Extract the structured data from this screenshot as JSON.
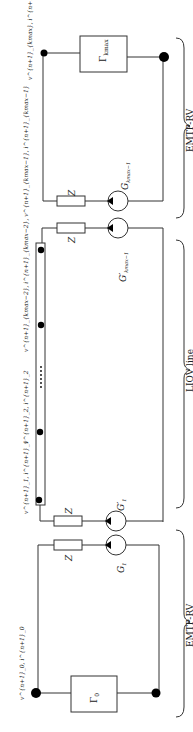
{
  "sections": {
    "top": "EMTP-RV",
    "middle": "LIOV line",
    "bottom": "EMTP-RV"
  },
  "components": {
    "gamma_top": "Γ_kmax",
    "gamma_bottom": "Γ_0",
    "impedance": "Z",
    "source_top": "G_kmax−1",
    "source_mid_top": "G'_kmax−1",
    "source_mid_bottom": "G'_1",
    "source_bottom": "G_1"
  },
  "node_labels": {
    "top": "v^{n+1}_{kmax}, i^{n+1}_{kmax}",
    "liov_end": "v^{n+1}_{kmax−2}, i^{n+1}_{kmax−2}  v^{n+1}_{kmax−1}, i^{n+1}_{kmax−1}",
    "liov_2": "v^{n+1}_2, i^{n+1}_2",
    "liov_1": "v^{n+1}_1, i^{n+1}_1",
    "bottom": "v^{n+1}_0, i^{n+1}_0"
  },
  "text": {
    "gamma_top_main": "Γ",
    "gamma_top_sub": "kmax",
    "gamma_bottom_main": "Γ",
    "gamma_bottom_sub": "0",
    "Z": "Z",
    "G": "G",
    "sub_kmax1": "kmax−1",
    "sub_1": "1",
    "prime_G": "G′",
    "dots": "······",
    "top_label_v": "v",
    "top_label": "v^{n+1}_{kmax}, i^{n+1}_{kmax}",
    "liov_label_a": "v^{n+1}_{kmax−2}, i^{n+1}_{kmax−2}, v^{n+1}_{kmax−1}, i^{n+1}_{kmax−1}",
    "liov_label_2": "v^{n+1}_2, i^{n+1}_2",
    "liov_label_1": "v^{n+1}_1, i^{n+1}_1",
    "bottom_label": "v^{n+1}_0, i^{n+1}_0"
  }
}
